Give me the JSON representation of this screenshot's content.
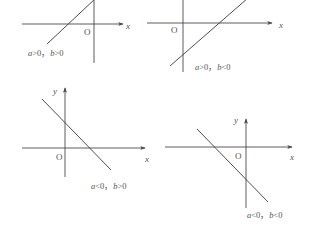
{
  "diagram": {
    "panels": [
      {
        "id": "p1",
        "condition": "a>0, b>0",
        "condition_display": "a>0，b>0",
        "x_label": "x",
        "y_label": "",
        "origin_label": "O",
        "xaxis": {
          "x1": 22,
          "x2": 123,
          "y": 24
        },
        "yaxis": {
          "x": 94,
          "y1": 0,
          "y2": 63
        },
        "line": {
          "x1": 47,
          "y1": 44,
          "x2": 96,
          "y2": -2
        },
        "pos": {
          "x_label": [
            126,
            29
          ],
          "origin": [
            84,
            35
          ],
          "cond": [
            28,
            56
          ]
        }
      },
      {
        "id": "p2",
        "condition": "a>0, b<0",
        "condition_display": "a>0，b<0",
        "x_label": "x",
        "y_label": "",
        "origin_label": "O",
        "xaxis": {
          "x1": 147,
          "x2": 272,
          "y": 23
        },
        "yaxis": {
          "x": 183,
          "y1": 0,
          "y2": 72
        },
        "line": {
          "x1": 170,
          "y1": 66,
          "x2": 248,
          "y2": -2
        },
        "pos": {
          "x_label": [
            279,
            28
          ],
          "origin": [
            171,
            33
          ],
          "cond": [
            195,
            70
          ]
        }
      },
      {
        "id": "p3",
        "condition": "a<0, b>0",
        "condition_display": "a<0，b>0",
        "x_label": "x",
        "y_label": "y",
        "origin_label": "O",
        "xaxis": {
          "x1": 22,
          "x2": 145,
          "y": 148
        },
        "yaxis": {
          "x": 65,
          "y1": 88,
          "y2": 177
        },
        "line": {
          "x1": 42,
          "y1": 99,
          "x2": 111,
          "y2": 170
        },
        "pos": {
          "x_label": [
            145,
            162
          ],
          "origin": [
            56,
            160
          ],
          "y_label": [
            53,
            94
          ],
          "cond": [
            91,
            189
          ]
        }
      },
      {
        "id": "p4",
        "condition": "a<0, b<0",
        "condition_display": "a<0，b<0",
        "x_label": "x",
        "y_label": "y",
        "origin_label": "O",
        "xaxis": {
          "x1": 165,
          "x2": 292,
          "y": 147
        },
        "yaxis": {
          "x": 246,
          "y1": 119,
          "y2": 208
        },
        "line": {
          "x1": 197,
          "y1": 129,
          "x2": 268,
          "y2": 202
        },
        "pos": {
          "x_label": [
            290,
            160
          ],
          "origin": [
            235,
            159
          ],
          "y_label": [
            234,
            123
          ],
          "cond": [
            247,
            218
          ]
        }
      }
    ]
  }
}
